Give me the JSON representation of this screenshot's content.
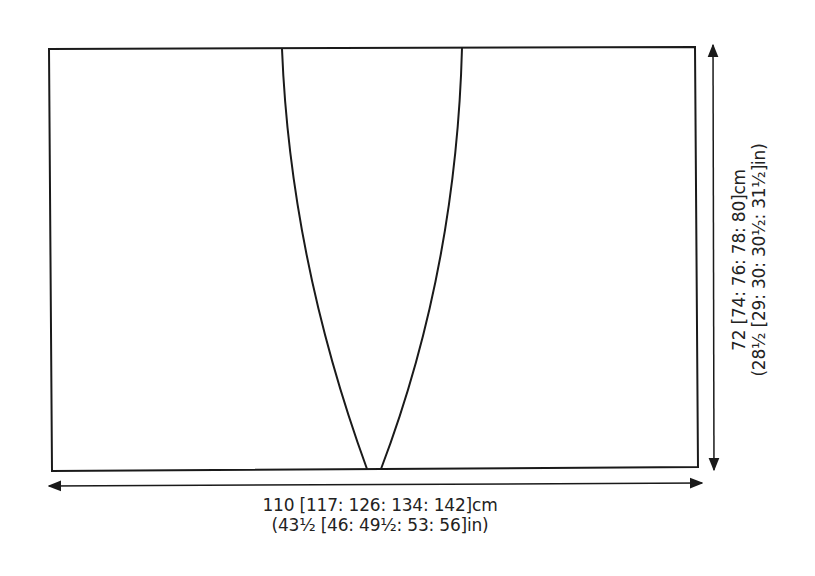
{
  "diagram": {
    "type": "knitting-schematic",
    "shape": "rectangle-with-curved-v-opening",
    "line_color": "#1a1a1a",
    "width_dimension": {
      "cm": "110 [117: 126: 134: 142]cm",
      "in": "(43½ [46: 49½: 53: 56]in)"
    },
    "height_dimension": {
      "cm": "72 [74: 76: 78: 80]cm",
      "in": "(28½ [29: 30: 30½: 31½]in)"
    }
  }
}
